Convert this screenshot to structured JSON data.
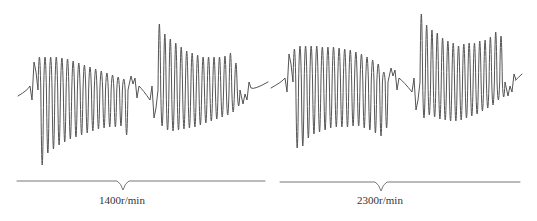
{
  "chart_data": [
    {
      "type": "line",
      "title": "",
      "panel": "left",
      "speed_label": "1400r/min",
      "xlabel": "",
      "ylabel": "",
      "grid": false,
      "legend": null,
      "description": "Vibration waveform trace with two decaying oscillation bursts and a once-per-revolution key-phase timing trace below",
      "colors": {
        "waveform": "#555555",
        "timing": "#777777"
      },
      "geometry": {
        "baseline_y": 90,
        "x_start": 18,
        "x_end": 268,
        "timing_line_y": 181,
        "timing_x_start": 17,
        "timing_x_end": 265,
        "notch_x": 123,
        "notch_depth": 9,
        "label_x": 122
      },
      "series": [
        {
          "name": "burst-1",
          "x_start": 38,
          "x_end": 128,
          "cycles": 16,
          "peaks_top_y": [
            57,
            57,
            57,
            57,
            58,
            59,
            61,
            63,
            65,
            67,
            69,
            71,
            73,
            75,
            77,
            79
          ],
          "troughs_bottom_y": [
            165,
            153,
            149,
            145,
            142,
            139,
            137,
            135,
            133,
            131,
            129,
            128,
            127,
            127,
            126,
            135
          ]
        },
        {
          "name": "burst-2",
          "x_start": 158,
          "x_end": 240,
          "cycles": 15,
          "peaks_top_y": [
            24,
            34,
            39,
            43,
            47,
            51,
            53,
            55,
            57,
            57,
            57,
            57,
            56,
            53,
            63
          ],
          "troughs_bottom_y": [
            126,
            130,
            131,
            130,
            129,
            128,
            127,
            125,
            123,
            121,
            119,
            117,
            115,
            112,
            106
          ]
        }
      ]
    },
    {
      "type": "line",
      "title": "",
      "panel": "right",
      "speed_label": "2300r/min",
      "xlabel": "",
      "ylabel": "",
      "grid": false,
      "legend": null,
      "description": "Vibration waveform trace with two oscillation bursts at higher rotational speed and a key-phase timing trace below",
      "colors": {
        "waveform": "#555555",
        "timing": "#777777"
      },
      "geometry": {
        "baseline_y": 82,
        "x_start": 271,
        "x_end": 522,
        "timing_line_y": 182,
        "timing_x_start": 280,
        "timing_x_end": 520,
        "notch_x": 381,
        "notch_depth": 9,
        "label_x": 380
      },
      "series": [
        {
          "name": "burst-1",
          "x_start": 293,
          "x_end": 388,
          "cycles": 17,
          "peaks_top_y": [
            49,
            46,
            46,
            46,
            46,
            47,
            47,
            47,
            48,
            49,
            50,
            52,
            54,
            57,
            60,
            64,
            72
          ],
          "troughs_bottom_y": [
            148,
            146,
            138,
            134,
            132,
            130,
            128,
            127,
            127,
            127,
            126,
            126,
            128,
            130,
            133,
            136,
            128
          ]
        },
        {
          "name": "burst-2",
          "x_start": 420,
          "x_end": 505,
          "cycles": 16,
          "peaks_top_y": [
            14,
            25,
            30,
            33,
            38,
            41,
            43,
            46,
            44,
            43,
            43,
            41,
            40,
            37,
            32,
            36
          ],
          "troughs_bottom_y": [
            118,
            115,
            117,
            119,
            120,
            121,
            121,
            120,
            118,
            116,
            114,
            111,
            108,
            105,
            100,
            97
          ]
        }
      ]
    }
  ],
  "labels": {
    "left": "1400r/min",
    "right": "2300r/min"
  }
}
